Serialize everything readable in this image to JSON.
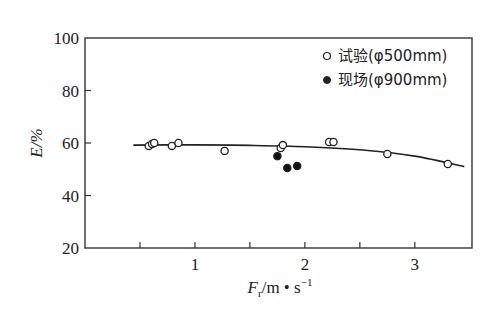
{
  "chart_data": {
    "type": "scatter",
    "title": "",
    "xlabel": "F_r/m·s⁻¹",
    "xlabel_parts": {
      "main": "F",
      "sub": "r",
      "rest": "/m • s",
      "sup": "−1"
    },
    "ylabel": "E/%",
    "xlim": [
      0,
      3.52
    ],
    "ylim": [
      20,
      100
    ],
    "x_ticks": [
      {
        "value": 0.5,
        "label": ""
      },
      {
        "value": 1,
        "label": "1"
      },
      {
        "value": 1.5,
        "label": ""
      },
      {
        "value": 2,
        "label": "2"
      },
      {
        "value": 2.5,
        "label": ""
      },
      {
        "value": 3,
        "label": "3"
      }
    ],
    "y_ticks": [
      {
        "value": 20,
        "label": "20"
      },
      {
        "value": 40,
        "label": "40"
      },
      {
        "value": 60,
        "label": "60"
      },
      {
        "value": 80,
        "label": "80"
      },
      {
        "value": 100,
        "label": "100"
      }
    ],
    "grid": false,
    "legend_position": "upper right",
    "series": [
      {
        "name": "试验(φ500mm)",
        "marker": "open-circle",
        "points": [
          {
            "x": 0.58,
            "y": 58.9
          },
          {
            "x": 0.61,
            "y": 59.6
          },
          {
            "x": 0.63,
            "y": 60.0
          },
          {
            "x": 0.79,
            "y": 58.9
          },
          {
            "x": 0.85,
            "y": 60.0
          },
          {
            "x": 1.27,
            "y": 57.0
          },
          {
            "x": 1.78,
            "y": 58.1
          },
          {
            "x": 1.8,
            "y": 59.2
          },
          {
            "x": 2.22,
            "y": 60.4
          },
          {
            "x": 2.26,
            "y": 60.4
          },
          {
            "x": 2.75,
            "y": 55.8
          },
          {
            "x": 3.3,
            "y": 52.0
          }
        ]
      },
      {
        "name": "现场(φ900mm)",
        "marker": "filled-circle",
        "points": [
          {
            "x": 1.75,
            "y": 55.0
          },
          {
            "x": 1.84,
            "y": 50.5
          },
          {
            "x": 1.93,
            "y": 51.2
          }
        ]
      }
    ],
    "fit_curve": {
      "name": "trend",
      "points": [
        {
          "x": 0.44,
          "y": 59.2
        },
        {
          "x": 1.0,
          "y": 59.3
        },
        {
          "x": 1.5,
          "y": 59.1
        },
        {
          "x": 2.0,
          "y": 58.6
        },
        {
          "x": 2.5,
          "y": 57.4
        },
        {
          "x": 3.0,
          "y": 55.0
        },
        {
          "x": 3.45,
          "y": 51.0
        }
      ]
    }
  },
  "legend": {
    "items": [
      {
        "label": "试验(φ500mm)",
        "marker": "open-circle"
      },
      {
        "label": "现场(φ900mm)",
        "marker": "filled-circle"
      }
    ]
  },
  "axes": {
    "ylabel": "E/%",
    "xlabel_main": "F",
    "xlabel_sub": "r",
    "xlabel_rest": "/m • s",
    "xlabel_sup": "−1"
  }
}
